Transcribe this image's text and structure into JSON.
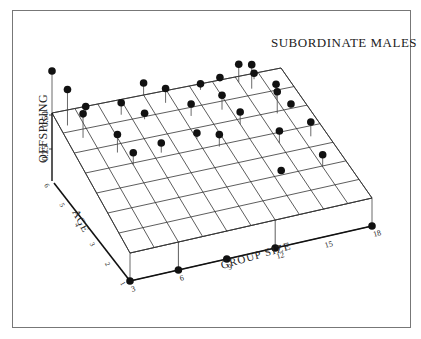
{
  "chart_data": {
    "type": "scatter3d",
    "title": "SUBORDINATE MALES",
    "xlabel": "GROUP SIZE",
    "ylabel": "AGE",
    "zlabel": "OFFSPRING",
    "x_ticks": [
      "3",
      "6",
      "9",
      "12",
      "15",
      "18"
    ],
    "y_ticks": [
      "1",
      "2",
      "3",
      "4",
      "5",
      "6"
    ],
    "z_ticks": [
      "0.25",
      "0.50"
    ],
    "xlim": [
      3,
      18
    ],
    "ylim": [
      1,
      6
    ],
    "zlim": [
      0,
      0.5
    ],
    "grid": true,
    "legend": null,
    "points": [
      {
        "group": 3,
        "age": 1,
        "offspring": 0.0
      },
      {
        "group": 6,
        "age": 1,
        "offspring": 0.0
      },
      {
        "group": 9,
        "age": 1,
        "offspring": 0.0
      },
      {
        "group": 12,
        "age": 1,
        "offspring": 0.0
      },
      {
        "group": 18,
        "age": 1,
        "offspring": 0.0
      },
      {
        "group": 3,
        "age": 6,
        "offspring": 0.35
      },
      {
        "group": 3.5,
        "age": 5.5,
        "offspring": 0.3
      },
      {
        "group": 4,
        "age": 5,
        "offspring": 0.2
      },
      {
        "group": 5.5,
        "age": 4.3,
        "offspring": 0.15
      },
      {
        "group": 6,
        "age": 3.8,
        "offspring": 0.1
      },
      {
        "group": 5,
        "age": 5.8,
        "offspring": 0.05
      },
      {
        "group": 7,
        "age": 5.5,
        "offspring": 0.1
      },
      {
        "group": 8.2,
        "age": 5.2,
        "offspring": 0.05
      },
      {
        "group": 8,
        "age": 4,
        "offspring": 0.08
      },
      {
        "group": 9,
        "age": 6,
        "offspring": 0.1
      },
      {
        "group": 10,
        "age": 5.6,
        "offspring": 0.12
      },
      {
        "group": 11,
        "age": 5,
        "offspring": 0.1
      },
      {
        "group": 10.5,
        "age": 4.2,
        "offspring": 0.05
      },
      {
        "group": 11.5,
        "age": 3.8,
        "offspring": 0.1
      },
      {
        "group": 12.5,
        "age": 5.8,
        "offspring": 0.05
      },
      {
        "group": 13,
        "age": 5,
        "offspring": 0.12
      },
      {
        "group": 13.5,
        "age": 4.4,
        "offspring": 0.1
      },
      {
        "group": 14,
        "age": 6,
        "offspring": 0.02
      },
      {
        "group": 15,
        "age": 5.8,
        "offspring": 0.15
      },
      {
        "group": 15.5,
        "age": 5.5,
        "offspring": 0.2
      },
      {
        "group": 16,
        "age": 5.8,
        "offspring": 0.05
      },
      {
        "group": 16.5,
        "age": 5,
        "offspring": 0.12
      },
      {
        "group": 16,
        "age": 4.5,
        "offspring": 0.18
      },
      {
        "group": 17,
        "age": 4.6,
        "offspring": 0.03
      },
      {
        "group": 17,
        "age": 3.5,
        "offspring": 0.12
      },
      {
        "group": 15,
        "age": 3.5,
        "offspring": 0.1
      },
      {
        "group": 14,
        "age": 2.5,
        "offspring": 0.02
      },
      {
        "group": 16.5,
        "age": 2.4,
        "offspring": 0.1
      }
    ]
  },
  "figure": {
    "title": "SUBORDINATE MALES",
    "axis_labels": {
      "x": "GROUP SIZE",
      "y": "AGE",
      "z": "OFFSPRING"
    }
  }
}
